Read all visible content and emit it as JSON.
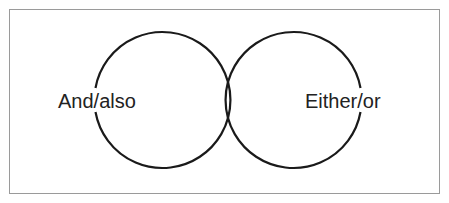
{
  "diagram": {
    "type": "two-circle diagram",
    "circles": [
      {
        "id": "left",
        "label": "And/also"
      },
      {
        "id": "right",
        "label": "Either/or"
      }
    ],
    "colors": {
      "stroke": "#1a1a1a",
      "frame": "#9a9a9a",
      "text": "#222222",
      "background": "#ffffff"
    }
  }
}
